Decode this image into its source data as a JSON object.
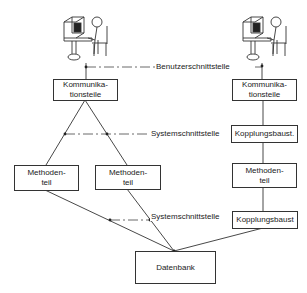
{
  "diagram": {
    "colors": {
      "line": "#333333",
      "background": "#ffffff",
      "text": "#222222"
    },
    "interfaces": {
      "user_interface": "Benutzerschnittstelle",
      "system_interface_top": "Systemschnittstelle",
      "system_interface_bottom": "Systemschnittstelle"
    },
    "left_system": {
      "icon": "user-at-computer-icon",
      "communication": {
        "line1": "Kommunika-",
        "line2": "tionsteile"
      },
      "method_a": {
        "line1": "Methoden-",
        "line2": "teil"
      },
      "method_b": {
        "line1": "Methoden-",
        "line2": "teil"
      }
    },
    "right_system": {
      "icon": "user-at-computer-icon",
      "communication": {
        "line1": "Kommunika-",
        "line2": "tionsteile"
      },
      "coupling_top": "Kopplungsbaust.",
      "method": {
        "line1": "Methoden-",
        "line2": "teil"
      },
      "coupling_bottom": "Kopplungsbaust"
    },
    "database": "Datenbank"
  }
}
